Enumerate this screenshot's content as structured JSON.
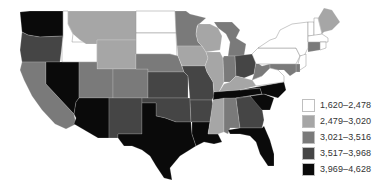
{
  "legend": {
    "items": [
      {
        "label": "1,620–2,478",
        "color": "#ffffff"
      },
      {
        "label": "2,479–3,020",
        "color": "#a6a6a6"
      },
      {
        "label": "3,021–3,516",
        "color": "#7a7a7a"
      },
      {
        "label": "3,517–3,968",
        "color": "#454545"
      },
      {
        "label": "3,969–4,628",
        "color": "#0a0a0a"
      }
    ]
  },
  "states": {
    "WA": 4,
    "OR": 3,
    "CA": 2,
    "NV": 4,
    "ID": 0,
    "MT": 1,
    "WY": 1,
    "UT": 2,
    "AZ": 4,
    "CO": 2,
    "NM": 3,
    "ND": 0,
    "SD": 0,
    "NE": 2,
    "KS": 3,
    "OK": 3,
    "TX": 4,
    "MN": 2,
    "IA": 1,
    "MO": 3,
    "AR": 3,
    "LA": 4,
    "WI": 1,
    "IL": 1,
    "MI": 2,
    "IN": 2,
    "OH": 3,
    "KY": 1,
    "TN": 4,
    "MS": 1,
    "AL": 2,
    "GA": 3,
    "FL": 4,
    "SC": 4,
    "NC": 4,
    "VA": 0,
    "WV": 2,
    "PA": 0,
    "NY": 0,
    "VT": 0,
    "NH": 0,
    "ME": 1,
    "MA": 0,
    "CT": 2,
    "RI": 0,
    "NJ": 0,
    "DE": 2,
    "MD": 2
  }
}
